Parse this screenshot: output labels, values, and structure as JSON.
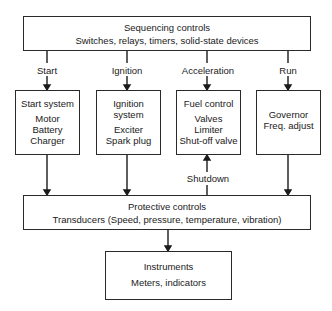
{
  "diagram": {
    "sequencing": {
      "title": "Sequencing controls",
      "subtitle": "Switches, relays, timers, solid-state devices"
    },
    "signals": {
      "start": "Start",
      "ignition": "Ignition",
      "acceleration": "Acceleration",
      "run": "Run",
      "shutdown": "Shutdown"
    },
    "start_system": {
      "title": "Start system",
      "items": [
        "Motor",
        "Battery",
        "Charger"
      ]
    },
    "ignition_system": {
      "title": "Ignition system",
      "items": [
        "Exciter",
        "Spark plug"
      ]
    },
    "fuel_control": {
      "title": "Fuel control",
      "items": [
        "Valves",
        "Limiter",
        "Shut-off valve"
      ]
    },
    "governor": {
      "items": [
        "Governor",
        "Freq. adjust"
      ]
    },
    "protective": {
      "title": "Protective controls",
      "subtitle": "Transducers (Speed, pressure, temperature, vibration)"
    },
    "instruments": {
      "title": "Instruments",
      "subtitle": "Meters, indicators"
    }
  }
}
